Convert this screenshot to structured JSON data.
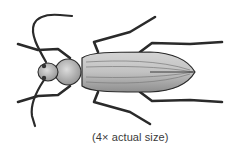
{
  "figure": {
    "style": "grayscale stipple drawing, dorsal view",
    "caption": "(4× actual size)"
  },
  "colors": {
    "background": "#ffffff",
    "ink": "#2a2a2a",
    "body_fill": "#b8b8b8",
    "caption_text": "#3a3a3a"
  }
}
